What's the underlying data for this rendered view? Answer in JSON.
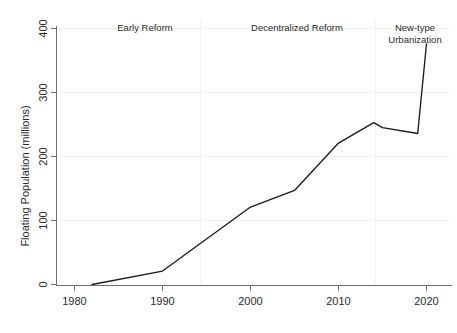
{
  "chart_data": {
    "type": "line",
    "title": "",
    "subtitle": "",
    "xlabel": "",
    "ylabel": "Floating Population (millions)",
    "xlim": [
      1978,
      2022
    ],
    "ylim": [
      0,
      400
    ],
    "xticks": [
      "1980",
      "1990",
      "2000",
      "2010",
      "2020"
    ],
    "xtick_values": [
      1980,
      1990,
      2000,
      2010,
      2020
    ],
    "yticks": [
      "0",
      "100",
      "200",
      "300",
      "400"
    ],
    "ytick_values": [
      0,
      100,
      200,
      300,
      400
    ],
    "grid": "faint-horizontal",
    "legend": "none",
    "line_color": "#1c1c1c",
    "x": [
      1982,
      1990,
      2000,
      2005,
      2010,
      2014,
      2015,
      2019,
      2020
    ],
    "values": [
      0,
      21,
      121,
      147,
      221,
      253,
      245,
      236,
      376
    ],
    "series": [
      {
        "name": "Floating Population",
        "x": [
          1982,
          1990,
          2000,
          2005,
          2010,
          2014,
          2015,
          2019,
          2020
        ],
        "values": [
          0,
          21,
          121,
          147,
          221,
          253,
          245,
          236,
          376
        ]
      }
    ],
    "annotations": [
      {
        "id": "early-reform",
        "lines": [
          "Early Reform"
        ],
        "x": 1987.5,
        "y": 395
      },
      {
        "id": "decentralized-reform",
        "lines": [
          "Decentralized Reform"
        ],
        "x": 2004.5,
        "y": 395
      },
      {
        "id": "new-type-urbanization",
        "lines": [
          "New-type",
          "Urbanization"
        ],
        "x": 2018.5,
        "y": 395
      }
    ]
  },
  "axes": {
    "y_title": "Floating Population (millions)",
    "y_ticks": [
      {
        "label": "400",
        "value": 400
      },
      {
        "label": "300",
        "value": 300
      },
      {
        "label": "200",
        "value": 200
      },
      {
        "label": "100",
        "value": 100
      },
      {
        "label": "0",
        "value": 0
      }
    ],
    "x_ticks": [
      {
        "label": "1980",
        "value": 1980
      },
      {
        "label": "1990",
        "value": 1990
      },
      {
        "label": "2000",
        "value": 2000
      },
      {
        "label": "2010",
        "value": 2010
      },
      {
        "label": "2020",
        "value": 2020
      }
    ]
  },
  "annotations": {
    "early_reform": "Early Reform",
    "decentralized_reform": "Decentralized Reform",
    "new_type_line1": "New-type",
    "new_type_line2": "Urbanization"
  }
}
